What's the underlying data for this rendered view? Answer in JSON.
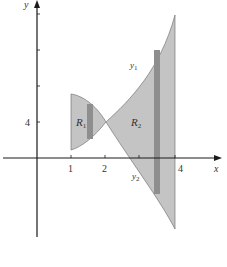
{
  "figure": {
    "type": "area-between-curves diagram",
    "axes": {
      "x_label": "x",
      "y_label": "y",
      "x_ticks": [
        {
          "value": 1,
          "label": "1"
        },
        {
          "value": 2,
          "label": "2"
        },
        {
          "value": 3,
          "label": ""
        },
        {
          "value": 4,
          "label": "4"
        }
      ],
      "y_ticks": [
        {
          "value": 4,
          "label": "4"
        },
        {
          "value": 8,
          "label": ""
        },
        {
          "value": 12,
          "label": ""
        },
        {
          "value": 16,
          "label": ""
        }
      ]
    },
    "curves": [
      {
        "name": "y1",
        "label_main": "y",
        "label_sub": "1"
      },
      {
        "name": "y2",
        "label_main": "y",
        "label_sub": "2"
      }
    ],
    "regions": [
      {
        "name": "R1",
        "label_main": "R",
        "label_sub": "1"
      },
      {
        "name": "R2",
        "label_main": "R",
        "label_sub": "2"
      }
    ],
    "colors": {
      "region_fill": "#c4c4c4",
      "strip_fill": "#8e8e8e",
      "axis": "#1a1a1a",
      "outline": "#555555"
    }
  }
}
